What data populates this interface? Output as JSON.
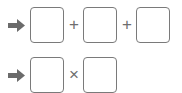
{
  "rows": [
    {
      "icon": "right-arrow-icon",
      "boxes": [
        "",
        "",
        ""
      ],
      "operators": [
        "+",
        "+"
      ]
    },
    {
      "icon": "right-arrow-icon",
      "boxes": [
        "",
        ""
      ],
      "operators": [
        "×"
      ]
    }
  ],
  "colors": {
    "arrow": "#6b6b6b",
    "box_border": "#7a7a7a",
    "operator": "#6e6e6e"
  }
}
